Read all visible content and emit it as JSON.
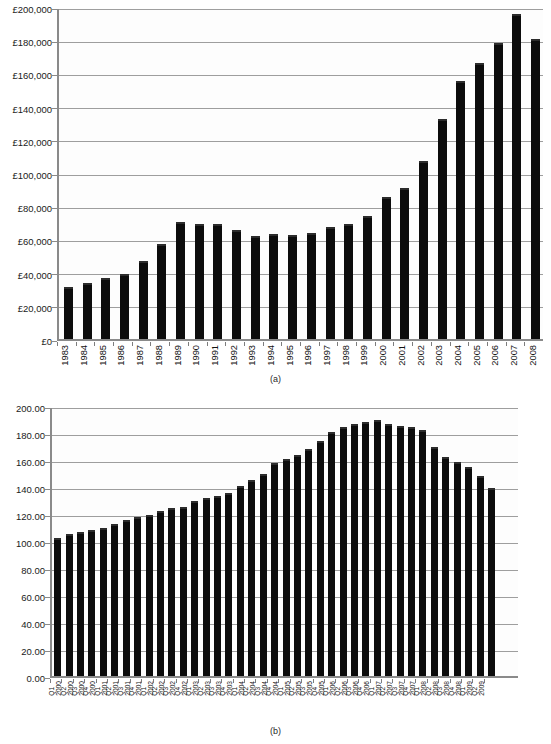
{
  "figure": {
    "caption_a": "(a)",
    "caption_b": "(b)"
  },
  "chart_data": [
    {
      "id": "chart-a",
      "type": "bar",
      "title": "",
      "subtitle": "",
      "xlabel": "",
      "ylabel": "",
      "caption": "(a)",
      "grid": true,
      "legend": "none",
      "ylim": [
        0,
        200000
      ],
      "ytick_step": 20000,
      "currency_symbol": "£",
      "ytick_labels": [
        "£0",
        "£20,000",
        "£40,000",
        "£60,000",
        "£80,000",
        "£100,000",
        "£120,000",
        "£140,000",
        "£160,000",
        "£180,000",
        "£200,000"
      ],
      "ytick_values": [
        0,
        20000,
        40000,
        60000,
        80000,
        100000,
        120000,
        140000,
        160000,
        180000,
        200000
      ],
      "categories": [
        "1983",
        "1984",
        "1985",
        "1986",
        "1987",
        "1988",
        "1989",
        "1990",
        "1991",
        "1992",
        "1993",
        "1994",
        "1995",
        "1996",
        "1997",
        "1998",
        "1999",
        "2000",
        "2001",
        "2002",
        "2003",
        "2004",
        "2005",
        "2006",
        "2007",
        "2008"
      ],
      "values": [
        31500,
        33500,
        36500,
        39000,
        47000,
        57500,
        70500,
        69500,
        69000,
        65500,
        62000,
        63000,
        62500,
        64000,
        67500,
        69500,
        74000,
        85500,
        91000,
        107000,
        132500,
        155500,
        166000,
        178500,
        195500,
        180500
      ]
    },
    {
      "id": "chart-b",
      "type": "bar",
      "title": "",
      "subtitle": "",
      "xlabel": "",
      "ylabel": "",
      "caption": "(b)",
      "grid": true,
      "legend": "none",
      "ylim": [
        0,
        200
      ],
      "ytick_step": 20,
      "ytick_labels": [
        "0.00",
        "20.00",
        "40.00",
        "60.00",
        "80.00",
        "100.00",
        "120.00",
        "140.00",
        "160.00",
        "180.00",
        "200.00"
      ],
      "ytick_values": [
        0,
        20,
        40,
        60,
        80,
        100,
        120,
        140,
        160,
        180,
        200
      ],
      "categories": [
        {
          "q": "Q1",
          "year": "2000"
        },
        {
          "q": "Q2",
          "year": "2000"
        },
        {
          "q": "Q3",
          "year": "2000"
        },
        {
          "q": "Q4",
          "year": "2000"
        },
        {
          "q": "Q1",
          "year": "2001"
        },
        {
          "q": "Q2",
          "year": "2001"
        },
        {
          "q": "Q3",
          "year": "2001"
        },
        {
          "q": "Q4",
          "year": "2001"
        },
        {
          "q": "Q1",
          "year": "2002"
        },
        {
          "q": "Q2",
          "year": "2002"
        },
        {
          "q": "Q3",
          "year": "2002"
        },
        {
          "q": "Q4",
          "year": "2002"
        },
        {
          "q": "Q1",
          "year": "2003"
        },
        {
          "q": "Q2",
          "year": "2003"
        },
        {
          "q": "Q3",
          "year": "2003"
        },
        {
          "q": "Q4",
          "year": "2003"
        },
        {
          "q": "Q1",
          "year": "2004"
        },
        {
          "q": "Q2",
          "year": "2004"
        },
        {
          "q": "Q3",
          "year": "2004"
        },
        {
          "q": "Q4",
          "year": "2004"
        },
        {
          "q": "Q1",
          "year": "2005"
        },
        {
          "q": "Q2",
          "year": "2005"
        },
        {
          "q": "Q3",
          "year": "2005"
        },
        {
          "q": "Q4",
          "year": "2005"
        },
        {
          "q": "Q1",
          "year": "2006"
        },
        {
          "q": "Q2",
          "year": "2006"
        },
        {
          "q": "Q3",
          "year": "2006"
        },
        {
          "q": "Q4",
          "year": "2006"
        },
        {
          "q": "Q1",
          "year": "2007"
        },
        {
          "q": "Q2",
          "year": "2007"
        },
        {
          "q": "Q3",
          "year": "2007"
        },
        {
          "q": "Q4",
          "year": "2007"
        },
        {
          "q": "Q1",
          "year": "2008"
        },
        {
          "q": "Q2",
          "year": "2008"
        },
        {
          "q": "Q3",
          "year": "2008"
        },
        {
          "q": "Q4",
          "year": "2008"
        },
        {
          "q": "Q1",
          "year": "2009"
        },
        {
          "q": "Q2",
          "year": "2009"
        }
      ],
      "values": [
        102.0,
        105.5,
        107.0,
        108.0,
        110.0,
        112.5,
        115.5,
        118.0,
        119.0,
        122.0,
        124.5,
        125.0,
        129.5,
        132.0,
        133.0,
        135.5,
        141.0,
        145.5,
        150.0,
        157.5,
        160.5,
        164.0,
        168.5,
        174.0,
        181.0,
        184.5,
        186.5,
        188.5,
        189.5,
        187.0,
        185.0,
        184.5,
        182.5,
        170.0,
        162.0,
        158.5,
        155.0,
        148.0,
        139.0,
        128.0,
        131.0
      ]
    }
  ],
  "colors": {
    "bar_fill": "#0c0c0c",
    "grid": "#9e9e9e",
    "axis": "#8a8a8a",
    "background": "#ffffff",
    "plot_background": "#fdfdfd",
    "text": "#111111"
  }
}
